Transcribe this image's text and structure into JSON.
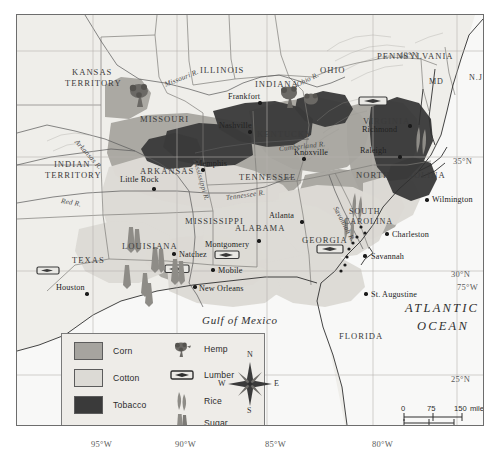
{
  "map": {
    "title": "Agriculture and Economy of the Southern United States, c. 1860",
    "ocean_label": "ATLANTIC OCEAN",
    "ocean_line1": "ATLANTIC",
    "ocean_line2": "OCEAN",
    "gulf_label": "Gulf of Mexico"
  },
  "graticule": {
    "latitudes": [
      {
        "label": "40°N",
        "x": 398,
        "y": 49
      },
      {
        "label": "35°N",
        "x": 452,
        "y": 155
      },
      {
        "label": "30°N",
        "x": 450,
        "y": 268
      },
      {
        "label": "25°N",
        "x": 450,
        "y": 373
      }
    ],
    "longitudes": [
      {
        "label": "95°W",
        "x": 91,
        "y": 439
      },
      {
        "label": "90°W",
        "x": 175,
        "y": 439
      },
      {
        "label": "85°W",
        "x": 265,
        "y": 439
      },
      {
        "label": "80°W",
        "x": 372,
        "y": 439
      },
      {
        "label": "75°W",
        "x": 456,
        "y": 281
      }
    ]
  },
  "states": [
    {
      "name": "KANSAS",
      "x": 55,
      "y": 52,
      "cls": "state"
    },
    {
      "name": "TERRITORY",
      "x": 48,
      "y": 63,
      "cls": "state"
    },
    {
      "name": "ILLINOIS",
      "x": 183,
      "y": 50,
      "cls": "state"
    },
    {
      "name": "INDIANA",
      "x": 238,
      "y": 64,
      "cls": "state"
    },
    {
      "name": "OHIO",
      "x": 303,
      "y": 50,
      "cls": "state"
    },
    {
      "name": "PENNSYLVANIA",
      "x": 360,
      "y": 36,
      "cls": "state"
    },
    {
      "name": "MISSOURI",
      "x": 123,
      "y": 99,
      "cls": "state"
    },
    {
      "name": "INDIAN",
      "x": 37,
      "y": 144,
      "cls": "state"
    },
    {
      "name": "TERRITORY",
      "x": 28,
      "y": 155,
      "cls": "state"
    },
    {
      "name": "ARKANSAS",
      "x": 123,
      "y": 151,
      "cls": "state"
    },
    {
      "name": "KENTUCKY",
      "x": 240,
      "y": 114,
      "cls": "state"
    },
    {
      "name": "TENNESSEE",
      "x": 222,
      "y": 157,
      "cls": "state"
    },
    {
      "name": "VIRGINIA",
      "x": 346,
      "y": 101,
      "cls": "state"
    },
    {
      "name": "NORTH CAROLINA",
      "x": 339,
      "y": 155,
      "cls": "state"
    },
    {
      "name": "SOUTH",
      "x": 332,
      "y": 192,
      "cls": "state2"
    },
    {
      "name": "CAROLINA",
      "x": 327,
      "y": 202,
      "cls": "state2"
    },
    {
      "name": "MISSISSIPPI",
      "x": 168,
      "y": 201,
      "cls": "state"
    },
    {
      "name": "ALABAMA",
      "x": 218,
      "y": 208,
      "cls": "state"
    },
    {
      "name": "GEORGIA",
      "x": 285,
      "y": 220,
      "cls": "state"
    },
    {
      "name": "LOUISIANA",
      "x": 105,
      "y": 226,
      "cls": "state"
    },
    {
      "name": "TEXAS",
      "x": 55,
      "y": 240,
      "cls": "state"
    },
    {
      "name": "FLORIDA",
      "x": 322,
      "y": 316,
      "cls": "state"
    },
    {
      "name": "MD",
      "x": 412,
      "y": 62,
      "cls": "state2"
    },
    {
      "name": "N.J.",
      "x": 452,
      "y": 58,
      "cls": "state2"
    },
    {
      "name": "DEL.",
      "x": 466,
      "y": 83,
      "cls": "state2"
    }
  ],
  "cities": [
    {
      "name": "Frankfort",
      "x": 243,
      "y": 88,
      "dx": -32,
      "dy": -11
    },
    {
      "name": "Nashville",
      "x": 233,
      "y": 117,
      "dx": -31,
      "dy": -11
    },
    {
      "name": "Richmond",
      "x": 393,
      "y": 111,
      "dx": -48,
      "dy": -1
    },
    {
      "name": "Memphis",
      "x": 186,
      "y": 155,
      "dx": -8,
      "dy": -11
    },
    {
      "name": "Knoxville",
      "x": 287,
      "y": 144,
      "dx": -10,
      "dy": -11
    },
    {
      "name": "Raleigh",
      "x": 383,
      "y": 142,
      "dx": -40,
      "dy": -11
    },
    {
      "name": "Little Rock",
      "x": 137,
      "y": 174,
      "dx": -34,
      "dy": -14
    },
    {
      "name": "Wilmington",
      "x": 410,
      "y": 185,
      "dx": 5,
      "dy": -5
    },
    {
      "name": "Charleston",
      "x": 370,
      "y": 219,
      "dx": 5,
      "dy": -4
    },
    {
      "name": "Savannah",
      "x": 348,
      "y": 241,
      "dx": 6,
      "dy": -4
    },
    {
      "name": "Atlanta",
      "x": 285,
      "y": 207,
      "dx": -33,
      "dy": -11
    },
    {
      "name": "Montgomery",
      "x": 242,
      "y": 226,
      "dx": -54,
      "dy": -1
    },
    {
      "name": "Natchez",
      "x": 157,
      "y": 239,
      "dx": 5,
      "dy": -4
    },
    {
      "name": "Mobile",
      "x": 196,
      "y": 255,
      "dx": 5,
      "dy": -4
    },
    {
      "name": "New Orleans",
      "x": 178,
      "y": 272,
      "dx": 4,
      "dy": -3
    },
    {
      "name": "Houston",
      "x": 70,
      "y": 279,
      "dx": -31,
      "dy": -11
    },
    {
      "name": "St. Augustine",
      "x": 349,
      "y": 279,
      "dx": 5,
      "dy": -4
    }
  ],
  "rivers": [
    {
      "name": "Missouri R.",
      "x": 148,
      "y": 66,
      "rot": -22
    },
    {
      "name": "Ohio R.",
      "x": 280,
      "y": 66,
      "rot": -26
    },
    {
      "name": "Arkansas R.",
      "x": 59,
      "y": 122,
      "rot": 48
    },
    {
      "name": "Red R.",
      "x": 44,
      "y": 182,
      "rot": 10
    },
    {
      "name": "Mississippi R.",
      "x": 178,
      "y": 140,
      "rot": 74
    },
    {
      "name": "Tennessee R.",
      "x": 209,
      "y": 179,
      "rot": -8
    },
    {
      "name": "Cumberland R.",
      "x": 262,
      "y": 130,
      "rot": -6
    },
    {
      "name": "Savannah R.",
      "x": 318,
      "y": 188,
      "rot": 62
    }
  ],
  "legend": {
    "areas": [
      {
        "label": "Corn",
        "color": "#a6a49f"
      },
      {
        "label": "Cotton",
        "color": "#dcdad5"
      },
      {
        "label": "Tobacco",
        "color": "#3a3a3a"
      }
    ],
    "symbols": [
      {
        "label": "Hemp",
        "icon": "hemp-icon"
      },
      {
        "label": "Lumber",
        "icon": "lumber-icon"
      },
      {
        "label": "Rice",
        "icon": "rice-icon"
      },
      {
        "label": "Sugar",
        "icon": "sugar-icon"
      }
    ]
  },
  "compass": {
    "north": "N",
    "south": "S",
    "east": "E",
    "west": "W"
  },
  "scale": {
    "miles_ticks": [
      "0",
      "75",
      "150"
    ],
    "miles_unit": "miles",
    "km_ticks": [
      "0",
      "75",
      "150"
    ],
    "km_unit": "kilometers",
    "miles_line": "0      75      150 miles",
    "km_line": "0    75   150 kilometers"
  },
  "colors": {
    "corn": "#a6a49f",
    "cotton": "#dcdad5",
    "tobacco": "#3a3a3a",
    "water": "#f7f7f6",
    "land": "#efeeea",
    "border": "#6d6d6d"
  }
}
